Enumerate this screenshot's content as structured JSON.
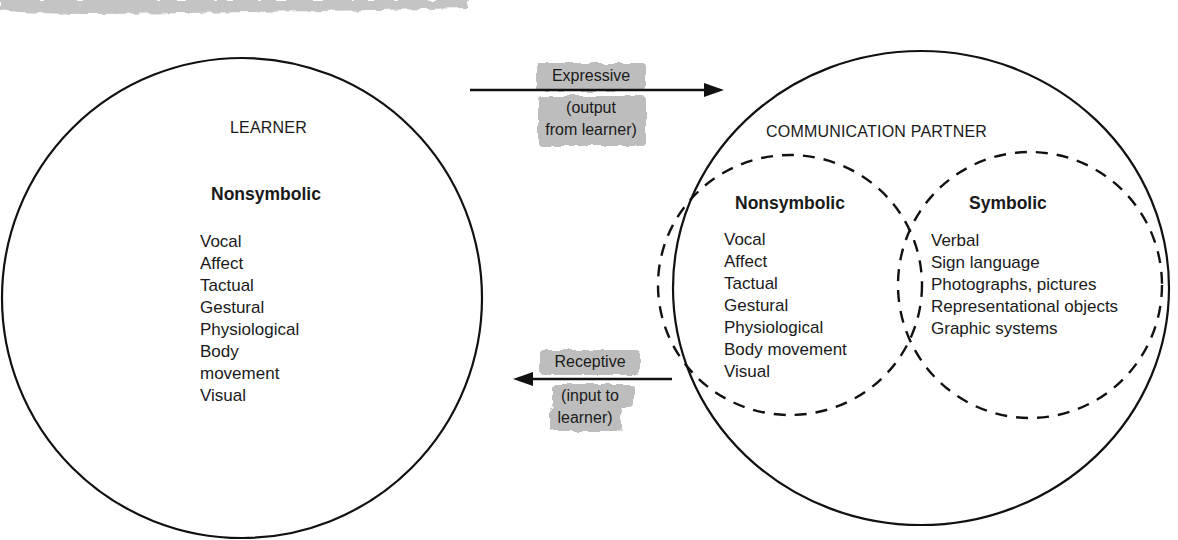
{
  "learner": {
    "title": "LEARNER",
    "category": "Nonsymbolic",
    "items": [
      "Vocal",
      "Affect",
      "Tactual",
      "Gestural",
      "Physiological",
      "Body",
      "movement",
      "Visual"
    ]
  },
  "partner": {
    "title": "COMMUNICATION PARTNER",
    "nonsymbolic": {
      "category": "Nonsymbolic",
      "items": [
        "Vocal",
        "Affect",
        "Tactual",
        "Gestural",
        "Physiological",
        "Body movement",
        "Visual"
      ]
    },
    "symbolic": {
      "category": "Symbolic",
      "items": [
        "Verbal",
        "Sign language",
        "Photographs, pictures",
        "Representational objects",
        "Graphic systems"
      ]
    }
  },
  "arrows": {
    "expressive": {
      "label": "Expressive",
      "sub1": "(output",
      "sub2": "from learner)",
      "direction": "right"
    },
    "receptive": {
      "label": "Receptive",
      "sub1": "(input to",
      "sub2": "learner)",
      "direction": "left"
    }
  },
  "colors": {
    "line": "#111111",
    "highlight": "#b8b8b8",
    "background": "#ffffff"
  }
}
